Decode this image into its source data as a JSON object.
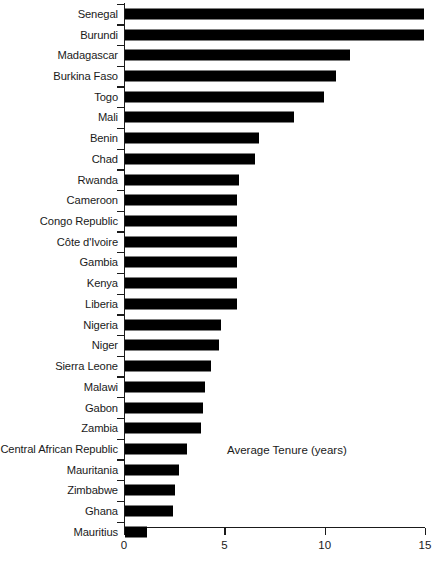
{
  "chart_data": {
    "type": "bar",
    "orientation": "horizontal",
    "title": "",
    "subtitle": "",
    "xlabel": "Average Tenure (years)",
    "ylabel": "",
    "annotation": "Average Tenure (years)",
    "xlim": [
      0,
      15
    ],
    "xticks": [
      0,
      5,
      10,
      15
    ],
    "xtick_labels": [
      "0",
      "5",
      "10",
      "15"
    ],
    "grid": false,
    "legend": null,
    "bar_color": "#000000",
    "axis_color": "#1a1a1a",
    "categories": [
      "Senegal",
      "Burundi",
      "Madagascar",
      "Burkina Faso",
      "Togo",
      "Mali",
      "Benin",
      "Chad",
      "Rwanda",
      "Cameroon",
      "Congo Republic",
      "Côte d'Ivoire",
      "Gambia",
      "Kenya",
      "Liberia",
      "Nigeria",
      "Niger",
      "Sierra Leone",
      "Malawi",
      "Gabon",
      "Zambia",
      "Central African Republic",
      "Mauritania",
      "Zimbabwe",
      "Ghana",
      "Mauritius"
    ],
    "values": [
      14.9,
      14.9,
      11.2,
      10.5,
      9.9,
      8.4,
      6.7,
      6.5,
      5.7,
      5.6,
      5.6,
      5.6,
      5.6,
      5.6,
      5.6,
      4.8,
      4.7,
      4.3,
      4.0,
      3.9,
      3.8,
      3.1,
      2.7,
      2.5,
      2.4,
      1.1
    ]
  }
}
